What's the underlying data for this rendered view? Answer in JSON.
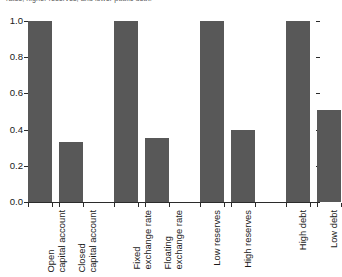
{
  "caption": {
    "text": "rates, higher reserves, and lower public debt."
  },
  "chart_data": {
    "type": "bar",
    "title": "",
    "subtitle": "",
    "xlabel": "",
    "ylabel": "",
    "ylim": [
      0.0,
      1.0
    ],
    "grid": false,
    "legend": "none",
    "bar_color": "#585858",
    "axis_color": "#2b2b2b",
    "yticks": [
      {
        "value": 1.0,
        "label": "1.0"
      },
      {
        "value": 0.8,
        "label": "0.8"
      },
      {
        "value": 0.6,
        "label": "0.6"
      },
      {
        "value": 0.4,
        "label": "0.4"
      },
      {
        "value": 0.2,
        "label": "0.2"
      },
      {
        "value": 0.0,
        "label": "0.0"
      }
    ],
    "categories": [
      "Open capital account",
      "Closed capital account",
      "Fixed exchange rate",
      "Floating exchange rate",
      "Low reserves",
      "High reserves",
      "High debt",
      "Low debt"
    ],
    "values": [
      1.0,
      0.33,
      1.0,
      0.355,
      1.0,
      0.4,
      1.0,
      0.51
    ],
    "bars": [
      {
        "category": "Open capital account",
        "label_lines": [
          "Open",
          "capital account"
        ],
        "value": 1.0,
        "group": 1
      },
      {
        "category": "Closed capital account",
        "label_lines": [
          "Closed",
          "capital account"
        ],
        "value": 0.33,
        "group": 1
      },
      {
        "category": "Fixed exchange rate",
        "label_lines": [
          "Fixed",
          "exchange rate"
        ],
        "value": 1.0,
        "group": 2
      },
      {
        "category": "Floating exchange rate",
        "label_lines": [
          "Floating",
          "exchange rate"
        ],
        "value": 0.355,
        "group": 2
      },
      {
        "category": "Low reserves",
        "label_lines": [
          "Low reserves"
        ],
        "value": 1.0,
        "group": 3
      },
      {
        "category": "High reserves",
        "label_lines": [
          "High reserves"
        ],
        "value": 0.4,
        "group": 3
      },
      {
        "category": "High debt",
        "label_lines": [
          "High debt"
        ],
        "value": 1.0,
        "group": 4
      },
      {
        "category": "Low debt",
        "label_lines": [
          "Low debt"
        ],
        "value": 0.51,
        "group": 4
      }
    ]
  }
}
